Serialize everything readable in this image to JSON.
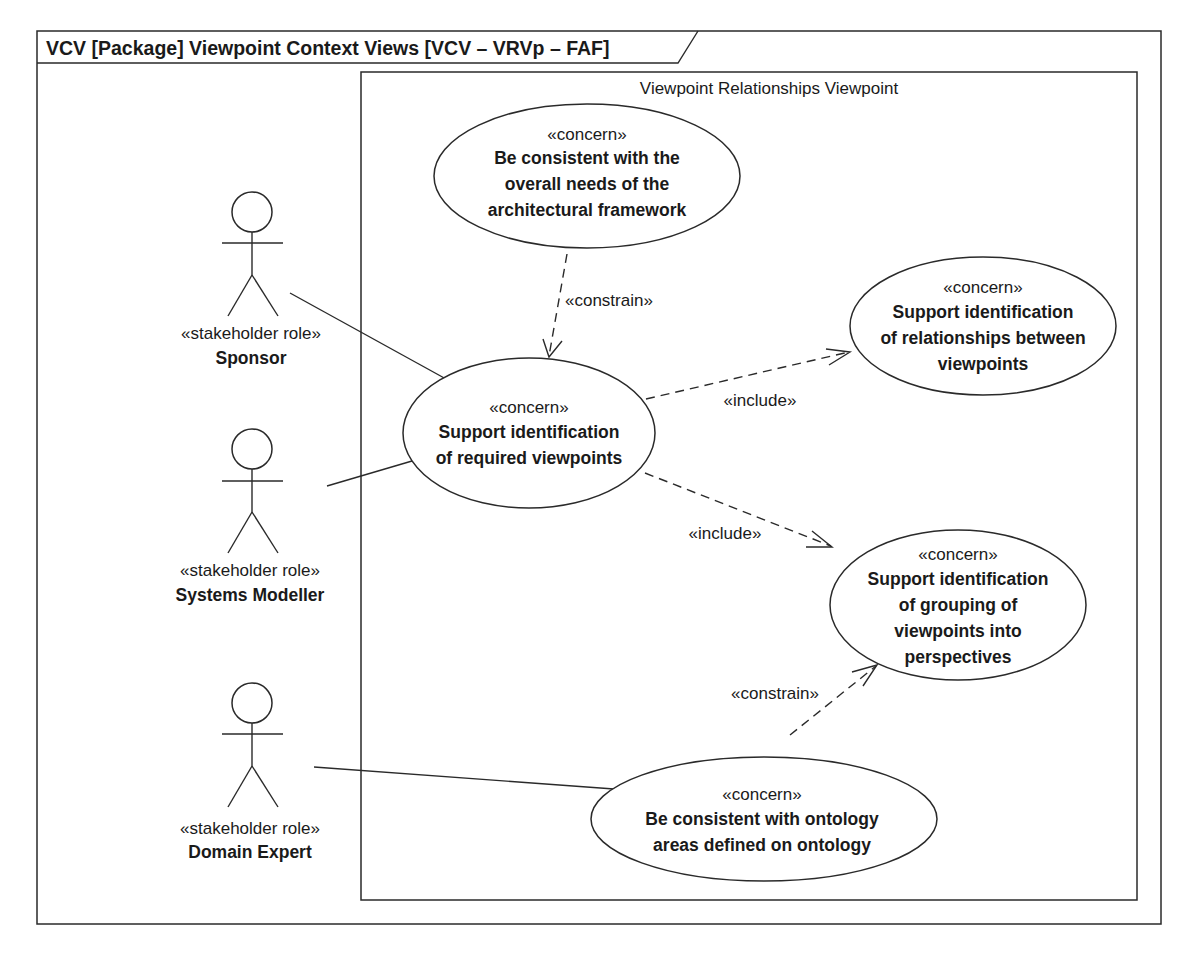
{
  "frame": {
    "title": "VCV [Package] Viewpoint Context Views [VCV – VRVp – FAF]"
  },
  "boundary": {
    "title": "Viewpoint Relationships Viewpoint"
  },
  "actors": [
    {
      "id": "sponsor",
      "stereotype": "«stakeholder role»",
      "name": "Sponsor"
    },
    {
      "id": "systems-modeller",
      "stereotype": "«stakeholder role»",
      "name": "Systems Modeller"
    },
    {
      "id": "domain-expert",
      "stereotype": "«stakeholder role»",
      "name": "Domain Expert"
    }
  ],
  "concerns": [
    {
      "id": "consistent-framework",
      "stereotype": "«concern»",
      "lines": [
        "Be consistent with the",
        "overall needs of the",
        "architectural framework"
      ]
    },
    {
      "id": "required-viewpoints",
      "stereotype": "«concern»",
      "lines": [
        "Support identification",
        "of required viewpoints"
      ]
    },
    {
      "id": "relationships-viewpoints",
      "stereotype": "«concern»",
      "lines": [
        "Support identification",
        "of relationships between",
        "viewpoints"
      ]
    },
    {
      "id": "grouping-perspectives",
      "stereotype": "«concern»",
      "lines": [
        "Support identification",
        "of grouping of",
        "viewpoints into",
        "perspectives"
      ]
    },
    {
      "id": "consistent-ontology",
      "stereotype": "«concern»",
      "lines": [
        "Be consistent with ontology",
        "areas defined on ontology"
      ]
    }
  ],
  "relationships": [
    {
      "type": "association",
      "from": "Sponsor",
      "to": "Support identification of required viewpoints"
    },
    {
      "type": "association",
      "from": "Systems Modeller",
      "to": "Support identification of required viewpoints"
    },
    {
      "type": "association",
      "from": "Domain Expert",
      "to": "Be consistent with ontology areas defined on ontology"
    },
    {
      "type": "dependency",
      "label": "«constrain»",
      "from": "Be consistent with the overall needs of the architectural framework",
      "to": "Support identification of required viewpoints"
    },
    {
      "type": "dependency",
      "label": "«include»",
      "from": "Support identification of required viewpoints",
      "to": "Support identification of relationships between viewpoints"
    },
    {
      "type": "dependency",
      "label": "«include»",
      "from": "Support identification of required viewpoints",
      "to": "Support identification of grouping of viewpoints into perspectives"
    },
    {
      "type": "dependency",
      "label": "«constrain»",
      "from": "Be consistent with ontology areas defined on ontology",
      "to": "Support identification of grouping of viewpoints into perspectives"
    }
  ]
}
